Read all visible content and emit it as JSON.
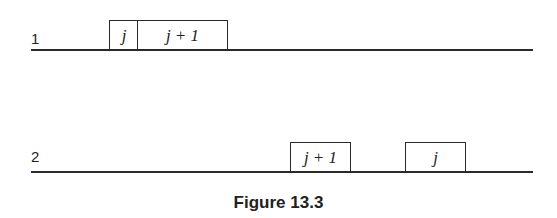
{
  "figure": {
    "caption": "Figure 13.3",
    "rows": [
      {
        "label": "1",
        "boxes": [
          {
            "text": "j"
          },
          {
            "text": "j + 1"
          }
        ]
      },
      {
        "label": "2",
        "boxes": [
          {
            "text": "j + 1"
          },
          {
            "text": "j"
          }
        ]
      }
    ]
  }
}
